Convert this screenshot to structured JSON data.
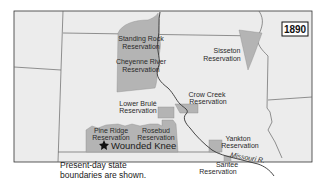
{
  "map": {
    "year": "1890",
    "note_line1": "Present-day state",
    "note_line2": "boundaries are shown.",
    "event_marker": "Wounded Knee",
    "river": "Missouri R.",
    "colors": {
      "background": "#ececec",
      "reservation": "#b4b4b4",
      "border": "#555555",
      "frame": "#333333"
    },
    "reservations": [
      {
        "name_line1": "Standing Rock",
        "name_line2": "Reservation"
      },
      {
        "name_line1": "Cheyenne River",
        "name_line2": "Reservation"
      },
      {
        "name_line1": "Sisseton",
        "name_line2": "Reservation"
      },
      {
        "name_line1": "Crow Creek",
        "name_line2": "Reservation"
      },
      {
        "name_line1": "Lower Brulé",
        "name_line2": "Reservation"
      },
      {
        "name_line1": "Pine Ridge",
        "name_line2": "Reservation"
      },
      {
        "name_line1": "Rosebud",
        "name_line2": "Reservation"
      },
      {
        "name_line1": "Yankton",
        "name_line2": "Reservation"
      },
      {
        "name_line1": "Santee",
        "name_line2": "Reservation"
      }
    ]
  }
}
